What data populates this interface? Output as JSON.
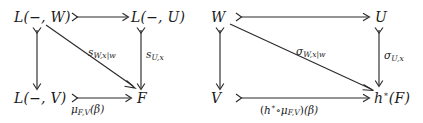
{
  "figure": {
    "kind": "commutative-diagram-pair",
    "ink_color": "#2b2b2b",
    "background": "#ffffff"
  },
  "left_diagram": {
    "name": "representable-functors-square",
    "nodes": {
      "top_left": {
        "script": "L",
        "args": "(−, W)"
      },
      "top_right": {
        "script": "L",
        "args": "(−, U)"
      },
      "bottom_left": {
        "script": "L",
        "args": "(−, V)"
      },
      "bottom_right": {
        "text": "F"
      }
    },
    "arrows": {
      "top": {
        "label": ""
      },
      "left": {
        "label": ""
      },
      "right": {
        "base": "s",
        "sub": "U,x"
      },
      "diagonal": {
        "base": "s",
        "sub": "W,x|w"
      },
      "bottom": {
        "base": "μ",
        "sub": "F,V",
        "arg": "(β)"
      }
    }
  },
  "right_diagram": {
    "name": "objects-square",
    "nodes": {
      "top_left": {
        "text": "W"
      },
      "top_right": {
        "text": "U"
      },
      "bottom_left": {
        "text": "V"
      },
      "bottom_right": {
        "pullback": "h",
        "star": "∗",
        "arg": "(F)"
      }
    },
    "arrows": {
      "top": {
        "label": ""
      },
      "left": {
        "label": ""
      },
      "right": {
        "base": "σ",
        "sub": "U,x"
      },
      "diagonal": {
        "base": "σ",
        "sub": "W,x|w"
      },
      "bottom": {
        "text_open": "(",
        "pullback": "h",
        "star": "∗",
        "compose": "∘",
        "mu": "μ",
        "mu_sub": "F,V",
        "text_close": ")",
        "arg": "(β)"
      }
    }
  }
}
